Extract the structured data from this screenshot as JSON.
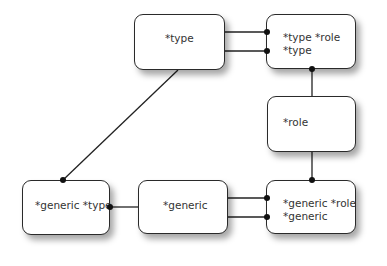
{
  "diagram": {
    "nodes": [
      {
        "id": "type",
        "lines": [
          "*type"
        ]
      },
      {
        "id": "type-role",
        "lines": [
          "*type *role",
          "*type"
        ]
      },
      {
        "id": "role",
        "lines": [
          "*role"
        ]
      },
      {
        "id": "generic-role",
        "lines": [
          "*generic *role",
          "*generic"
        ]
      },
      {
        "id": "generic",
        "lines": [
          "*generic"
        ]
      },
      {
        "id": "generic-type",
        "lines": [
          "*generic *type"
        ]
      }
    ],
    "edges": [
      {
        "from": "type",
        "to": "type-role",
        "count": 2
      },
      {
        "from": "type-role",
        "to": "role",
        "count": 1
      },
      {
        "from": "role",
        "to": "generic-role",
        "count": 1
      },
      {
        "from": "generic",
        "to": "generic-role",
        "count": 2
      },
      {
        "from": "generic-type",
        "to": "generic",
        "count": 1
      },
      {
        "from": "type",
        "to": "generic-type",
        "count": 1
      }
    ],
    "colors": {
      "line": "#222222",
      "box_border": "#2a2a2a",
      "background": "#ffffff"
    }
  }
}
